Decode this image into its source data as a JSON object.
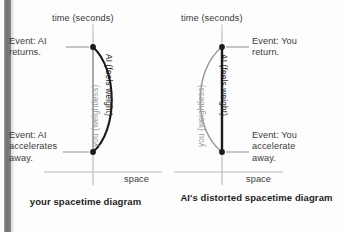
{
  "figure": {
    "type": "spacetime-diagram-pair",
    "panels": [
      {
        "id": "left",
        "caption": "your spacetime diagram",
        "time_axis_label": "time (seconds)",
        "space_axis_label": "space",
        "event_top": "Event: AI\nreturns.",
        "event_bottom": "Event: AI\naccelerates\naway.",
        "worldline_straight_label": "you (weightless)",
        "worldline_curved_label": "AI (feels weight)",
        "straight_line_color": "#9b9b9b",
        "curved_line_color": "#1a1a1a",
        "curve_bulge": "right",
        "bold_worldline": "curved"
      },
      {
        "id": "right",
        "caption": "AI's distorted\nspacetime diagram",
        "time_axis_label": "time (seconds)",
        "space_axis_label": "space",
        "event_top": "Event: You\nreturn.",
        "event_bottom": "Event: You\naccelerate\naway.",
        "worldline_straight_label": "AI (feels weight)",
        "worldline_curved_label": "you (weightless)",
        "straight_line_color": "#1a1a1a",
        "curved_line_color": "#9b9b9b",
        "curve_bulge": "left",
        "bold_worldline": "straight"
      }
    ],
    "colors": {
      "axis": "#b4b4b4",
      "text": "#3a3a3a",
      "caption": "#1d1d1d",
      "gray_line": "#9b9b9b",
      "black_line": "#1a1a1a",
      "background": "#fdfdfd"
    }
  }
}
